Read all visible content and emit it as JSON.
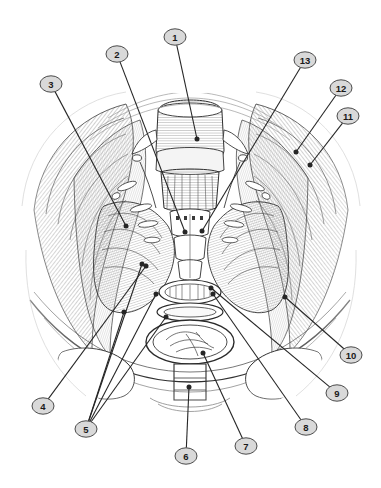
{
  "figure": {
    "kind": "anatomical-line-illustration",
    "style": "black-and-white engraved hatch line art",
    "background_color": "#ffffff",
    "line_color": "#2b2b2b",
    "hatch_color": "#8d8d8d",
    "width": 381,
    "height": 488
  },
  "markers": {
    "shape": "ellipse",
    "fill_color": "#d9d9d9",
    "stroke_color": "#4a4a4a",
    "text_color": "#1a1a1a",
    "leader_color": "#262626",
    "rx": 11,
    "ry": 8.2,
    "items": [
      {
        "id": "1",
        "label": "1",
        "cx": 175,
        "cy": 37,
        "tip_x": 197,
        "tip_y": 139,
        "dot": true
      },
      {
        "id": "2",
        "label": "2",
        "cx": 117,
        "cy": 54,
        "tip_x": 185,
        "tip_y": 232,
        "dot": true
      },
      {
        "id": "3",
        "label": "3",
        "cx": 51,
        "cy": 84,
        "tip_x": 126,
        "tip_y": 226,
        "dot": true
      },
      {
        "id": "4",
        "label": "4",
        "cx": 43,
        "cy": 406,
        "tip_x": 146,
        "tip_y": 266,
        "dot": true
      },
      {
        "id": "5",
        "label": "5",
        "cx": 86,
        "cy": 429,
        "tip_x": 124,
        "tip_y": 312,
        "dot": true
      },
      {
        "id": "6",
        "label": "6",
        "cx": 186,
        "cy": 456,
        "tip_x": 189,
        "tip_y": 387,
        "dot": true
      },
      {
        "id": "7",
        "label": "7",
        "cx": 246,
        "cy": 446,
        "tip_x": 203,
        "tip_y": 353,
        "dot": true
      },
      {
        "id": "8",
        "label": "8",
        "cx": 306,
        "cy": 427,
        "tip_x": 213,
        "tip_y": 294,
        "dot": true
      },
      {
        "id": "9",
        "label": "9",
        "cx": 337,
        "cy": 393,
        "tip_x": 211,
        "tip_y": 288,
        "dot": true
      },
      {
        "id": "10",
        "label": "10",
        "cx": 351,
        "cy": 355,
        "tip_x": 285,
        "tip_y": 297,
        "dot": true
      },
      {
        "id": "11",
        "label": "11",
        "cx": 348,
        "cy": 116,
        "tip_x": 310,
        "tip_y": 165,
        "dot": true
      },
      {
        "id": "12",
        "label": "12",
        "cx": 341,
        "cy": 88,
        "tip_x": 296,
        "tip_y": 152,
        "dot": true
      },
      {
        "id": "13",
        "label": "13",
        "cx": 305,
        "cy": 60,
        "tip_x": 202,
        "tip_y": 231,
        "dot": true
      }
    ],
    "extra_leaders_for_5": [
      {
        "from": "5",
        "tip_x": 142,
        "tip_y": 264,
        "dot": true
      },
      {
        "from": "5",
        "tip_x": 156,
        "tip_y": 294,
        "dot": true
      },
      {
        "from": "5",
        "tip_x": 166,
        "tip_y": 317,
        "dot": true
      }
    ]
  }
}
